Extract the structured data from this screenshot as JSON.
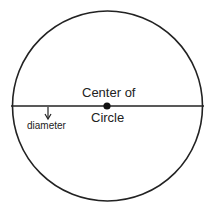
{
  "diagram": {
    "labels": {
      "center_line1": "Center of",
      "center_line2": "Circle",
      "diameter": "diameter"
    },
    "shapes": {
      "circle": {
        "cx": 107.5,
        "cy": 106,
        "r": 95
      },
      "diameter_line": {
        "x1": 11,
        "y1": 106,
        "x2": 204,
        "y2": 106
      },
      "center_point": {
        "cx": 107,
        "cy": 106,
        "r": 3.5
      },
      "arrow": {
        "x": 48,
        "y1": 107,
        "y2": 118
      }
    },
    "colors": {
      "stroke": "#222222",
      "background": "#ffffff"
    }
  }
}
